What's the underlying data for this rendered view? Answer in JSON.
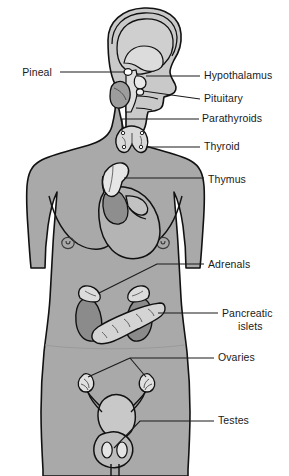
{
  "figure": {
    "colors": {
      "background": "#ffffff",
      "body_fill": "#a9a9a9",
      "body_outline": "#111111",
      "organ_light": "#d7d7d7",
      "organ_mid": "#b6b6b6",
      "organ_dark": "#8a8a8a",
      "brain_fill": "#cfcfcf",
      "label_text": "#1a1a1a",
      "leader_line": "#1a1a1a"
    }
  },
  "labels": {
    "left": [
      {
        "id": "pineal",
        "text": "Pineal",
        "x": 52,
        "y": 76
      }
    ],
    "right": [
      {
        "id": "hypothalamus",
        "text": "Hypothalamus",
        "x": 204,
        "y": 79
      },
      {
        "id": "pituitary",
        "text": "Pituitary",
        "x": 204,
        "y": 102
      },
      {
        "id": "parathyroids",
        "text": "Parathyroids",
        "x": 202,
        "y": 122
      },
      {
        "id": "thyroid",
        "text": "Thyroid",
        "x": 204,
        "y": 150
      },
      {
        "id": "thymus",
        "text": "Thymus",
        "x": 208,
        "y": 183
      },
      {
        "id": "adrenals",
        "text": "Adrenals",
        "x": 208,
        "y": 268
      },
      {
        "id": "pancreatic-islets-line1",
        "text": "Pancreatic",
        "x": 222,
        "y": 317
      },
      {
        "id": "pancreatic-islets-line2",
        "text": "islets",
        "x": 222,
        "y": 330
      },
      {
        "id": "ovaries",
        "text": "Ovaries",
        "x": 218,
        "y": 361
      },
      {
        "id": "testes",
        "text": "Testes",
        "x": 218,
        "y": 424
      }
    ]
  },
  "glands": [
    {
      "id": "pineal",
      "name": "Pineal gland",
      "region": "brain"
    },
    {
      "id": "hypothalamus",
      "name": "Hypothalamus",
      "region": "brain"
    },
    {
      "id": "pituitary",
      "name": "Pituitary gland",
      "region": "brain"
    },
    {
      "id": "parathyroids",
      "name": "Parathyroid glands",
      "region": "neck"
    },
    {
      "id": "thyroid",
      "name": "Thyroid gland",
      "region": "neck"
    },
    {
      "id": "thymus",
      "name": "Thymus",
      "region": "thorax"
    },
    {
      "id": "adrenals",
      "name": "Adrenal glands",
      "region": "abdomen"
    },
    {
      "id": "pancreatic-islets",
      "name": "Pancreatic islets",
      "region": "abdomen"
    },
    {
      "id": "ovaries",
      "name": "Ovaries",
      "region": "pelvis"
    },
    {
      "id": "testes",
      "name": "Testes",
      "region": "pelvis"
    }
  ]
}
